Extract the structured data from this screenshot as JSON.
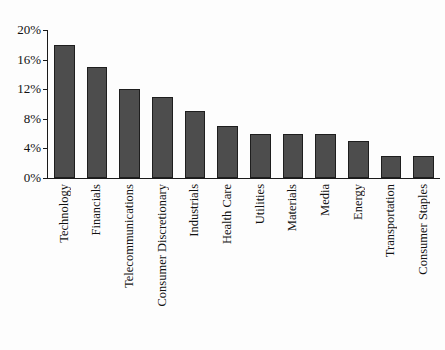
{
  "chart_data": {
    "type": "bar",
    "title": "",
    "subtitle": "",
    "xlabel": "",
    "ylabel": "",
    "ylim": [
      0,
      20
    ],
    "yunit": "%",
    "grid": false,
    "legend": null,
    "orientation": "vertical",
    "bar_color": "#4d4d4d",
    "bar_edge_color": "#1e1e1e",
    "background_color": "#fdfdfd",
    "axis_color": "#1a1a1a",
    "y_ticks": [
      {
        "value": 20,
        "label": "20%"
      },
      {
        "value": 16,
        "label": "16%"
      },
      {
        "value": 12,
        "label": "12%"
      },
      {
        "value": 8,
        "label": "8%"
      },
      {
        "value": 4,
        "label": "4%"
      },
      {
        "value": 0,
        "label": "0%"
      }
    ],
    "categories": [
      "Technology",
      "Financials",
      "Telecommunications",
      "Consumer Discretionary",
      "Industrials",
      "Health Care",
      "Utilities",
      "Materials",
      "Media",
      "Energy",
      "Transportation",
      "Consumer Staples"
    ],
    "values": [
      18,
      15,
      12,
      11,
      9,
      7,
      6,
      6,
      6,
      5,
      3,
      3
    ],
    "series": [
      {
        "name": "Share",
        "values": [
          18,
          15,
          12,
          11,
          9,
          7,
          6,
          6,
          6,
          5,
          3,
          3
        ]
      }
    ]
  }
}
